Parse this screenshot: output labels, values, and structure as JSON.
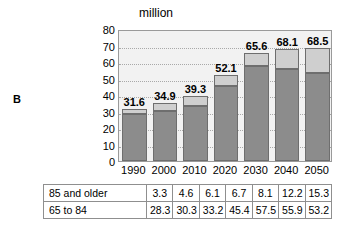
{
  "panel": {
    "letter": "B"
  },
  "chart_data": {
    "type": "bar",
    "subtype": "stacked-bar",
    "title": "",
    "unit_label": "million",
    "xlabel": "",
    "ylabel": "",
    "ylim": [
      0,
      80
    ],
    "ytick_step": 10,
    "yticks": [
      "80",
      "70",
      "60",
      "50",
      "40",
      "30",
      "20",
      "10",
      "0"
    ],
    "grid": true,
    "grid_style": "dotted-horizontal",
    "legend": "none",
    "categories": [
      "1990",
      "2000",
      "2010",
      "2020",
      "2030",
      "2040",
      "2050"
    ],
    "series": [
      {
        "name": "65 to  84",
        "color": "#8c8c8c",
        "values": [
          28.3,
          30.3,
          33.2,
          45.4,
          57.5,
          55.9,
          53.2
        ]
      },
      {
        "name": "85 and older",
        "color": "#cfcfcf",
        "values": [
          3.3,
          4.6,
          6.1,
          6.7,
          8.1,
          12.2,
          15.3
        ]
      }
    ],
    "totals": [
      31.6,
      34.9,
      39.3,
      52.1,
      65.6,
      68.1,
      68.5
    ],
    "total_labels": [
      "31.6",
      "34.9",
      "39.3",
      "52.1",
      "65.6",
      "68.1",
      "68.5"
    ]
  },
  "table": {
    "rows": [
      {
        "label": "85 and older",
        "values": [
          "3.3",
          "4.6",
          "6.1",
          "6.7",
          "8.1",
          "12.2",
          "15.3"
        ]
      },
      {
        "label": "65 to  84",
        "values": [
          "28.3",
          "30.3",
          "33.2",
          "45.4",
          "57.5",
          "55.9",
          "53.2"
        ]
      }
    ]
  }
}
